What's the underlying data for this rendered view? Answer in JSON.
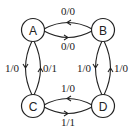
{
  "diagram": {
    "type": "state-machine",
    "colors": {
      "stroke": "#222222",
      "background": "#ffffff"
    },
    "states": [
      {
        "id": "A",
        "label": "A",
        "cx": 33,
        "cy": 30
      },
      {
        "id": "B",
        "label": "B",
        "cx": 103,
        "cy": 30
      },
      {
        "id": "C",
        "label": "C",
        "cx": 33,
        "cy": 106
      },
      {
        "id": "D",
        "label": "D",
        "cx": 103,
        "cy": 106
      }
    ],
    "transitions": [
      {
        "from": "B",
        "to": "A",
        "label": "0/0",
        "position": "top"
      },
      {
        "from": "A",
        "to": "B",
        "label": "0/0",
        "position": "bottom"
      },
      {
        "from": "A",
        "to": "C",
        "label": "1/0",
        "position": "left"
      },
      {
        "from": "C",
        "to": "A",
        "label": "0/1",
        "position": "right"
      },
      {
        "from": "B",
        "to": "D",
        "label": "1/0",
        "position": "left"
      },
      {
        "from": "D",
        "to": "B",
        "label": "1/0",
        "position": "right"
      },
      {
        "from": "D",
        "to": "C",
        "label": "1/0",
        "position": "top"
      },
      {
        "from": "C",
        "to": "D",
        "label": "1/1",
        "position": "bottom"
      }
    ]
  }
}
